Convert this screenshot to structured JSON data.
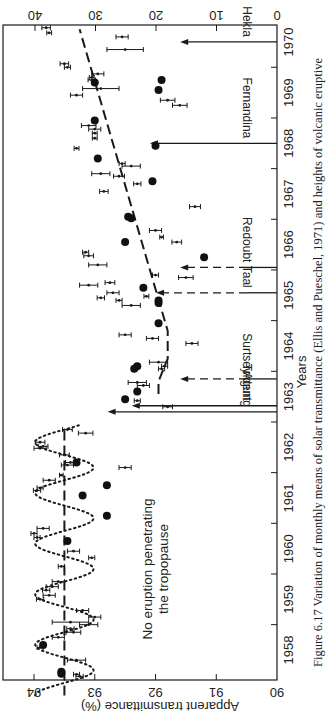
{
  "chart_data": {
    "type": "scatter",
    "title": "",
    "caption": "Figure 6.17 Variation of monthly means of solar transmittance (Ellis and Pueschel, 1971) and heights of volcanic eruptive",
    "xlabel": "Years",
    "ylabel": "Apparent transmittance (%)",
    "ylabel_right": "",
    "xlim": [
      1957.6,
      1970.5
    ],
    "ylim": [
      90,
      94.4
    ],
    "ylim_right": [
      0,
      44
    ],
    "x_ticks": [
      1958,
      1959,
      1960,
      1961,
      1962,
      1963,
      1964,
      1965,
      1966,
      1967,
      1968,
      1969,
      1970
    ],
    "y_ticks": [
      90,
      91,
      92,
      93,
      94
    ],
    "y_ticks_right": [
      0,
      10,
      20,
      30,
      40
    ],
    "grid": false,
    "annotation": "No eruption penetrating the tropopause",
    "series": [
      {
        "name": "Monthly mean transmittance (with error bars)",
        "marker": "dot-errorbar",
        "points": [
          {
            "x": 1957.62,
            "y": 93.9,
            "e": 0.05
          },
          {
            "x": 1957.78,
            "y": 93.65,
            "e": 0.12
          },
          {
            "x": 1957.9,
            "y": 93.3,
            "e": 0.1
          },
          {
            "x": 1957.98,
            "y": 93.25,
            "e": 0.06
          },
          {
            "x": 1958.02,
            "y": 93.3,
            "e": 0.05
          },
          {
            "x": 1958.3,
            "y": 93.3,
            "e": 0.15
          },
          {
            "x": 1958.55,
            "y": 93.9,
            "e": 0.05
          },
          {
            "x": 1958.75,
            "y": 93.6,
            "e": 0.1
          },
          {
            "x": 1958.85,
            "y": 93.35,
            "e": 0.12
          },
          {
            "x": 1958.92,
            "y": 93.4,
            "e": 0.06
          },
          {
            "x": 1959.0,
            "y": 93.1,
            "e": 0.15
          },
          {
            "x": 1959.05,
            "y": 93.4,
            "e": 0.3
          },
          {
            "x": 1959.15,
            "y": 93.0,
            "e": 0.1
          },
          {
            "x": 1959.28,
            "y": 93.2,
            "e": 0.1
          },
          {
            "x": 1959.5,
            "y": 93.9,
            "e": 0.06
          },
          {
            "x": 1959.58,
            "y": 93.75,
            "e": 0.1
          },
          {
            "x": 1959.68,
            "y": 93.8,
            "e": 0.06
          },
          {
            "x": 1959.75,
            "y": 93.7,
            "e": 0.1
          },
          {
            "x": 1959.85,
            "y": 93.6,
            "e": 0.1
          },
          {
            "x": 1960.15,
            "y": 93.55,
            "e": 0.05
          },
          {
            "x": 1960.32,
            "y": 93.05,
            "e": 0.05
          },
          {
            "x": 1960.45,
            "y": 93.35,
            "e": 0.1
          },
          {
            "x": 1960.72,
            "y": 93.95,
            "e": 0.05
          },
          {
            "x": 1960.8,
            "y": 94.0,
            "e": 0.05
          },
          {
            "x": 1960.9,
            "y": 93.85,
            "e": 0.1
          },
          {
            "x": 1961.65,
            "y": 93.95,
            "e": 0.06
          },
          {
            "x": 1961.7,
            "y": 93.9,
            "e": 0.05
          },
          {
            "x": 1961.85,
            "y": 93.75,
            "e": 0.1
          },
          {
            "x": 1961.95,
            "y": 93.55,
            "e": 0.03
          },
          {
            "x": 1962.1,
            "y": 92.5,
            "e": 0.1
          },
          {
            "x": 1962.15,
            "y": 93.45,
            "e": 0.1
          },
          {
            "x": 1962.2,
            "y": 93.4,
            "e": 0.08
          },
          {
            "x": 1962.35,
            "y": 93.5,
            "e": 0.08
          },
          {
            "x": 1962.48,
            "y": 93.9,
            "e": 0.1
          },
          {
            "x": 1962.52,
            "y": 93.85,
            "e": 0.08
          },
          {
            "x": 1962.6,
            "y": 93.9,
            "e": 0.08
          },
          {
            "x": 1962.78,
            "y": 93.15,
            "e": 0.12
          },
          {
            "x": 1962.85,
            "y": 93.45,
            "e": 0.08
          },
          {
            "x": 1963.3,
            "y": 91.8,
            "e": 0.08
          },
          {
            "x": 1963.42,
            "y": 92.3,
            "e": 0.05
          },
          {
            "x": 1963.72,
            "y": 92.2,
            "e": 0.1
          },
          {
            "x": 1963.78,
            "y": 92.3,
            "e": 0.15
          },
          {
            "x": 1964.05,
            "y": 91.9,
            "e": 0.05
          },
          {
            "x": 1964.1,
            "y": 91.85,
            "e": 0.05
          },
          {
            "x": 1964.18,
            "y": 91.95,
            "e": 0.15
          },
          {
            "x": 1964.55,
            "y": 91.4,
            "e": 0.1
          },
          {
            "x": 1964.65,
            "y": 92.05,
            "e": 0.1
          },
          {
            "x": 1964.72,
            "y": 92.5,
            "e": 0.1
          },
          {
            "x": 1965.3,
            "y": 92.4,
            "e": 0.15
          },
          {
            "x": 1965.4,
            "y": 92.6,
            "e": 0.05
          },
          {
            "x": 1965.45,
            "y": 92.9,
            "e": 0.06
          },
          {
            "x": 1965.48,
            "y": 92.15,
            "e": 0.04
          },
          {
            "x": 1965.55,
            "y": 92.7,
            "e": 0.1
          },
          {
            "x": 1965.7,
            "y": 93.1,
            "e": 0.15
          },
          {
            "x": 1965.75,
            "y": 92.75,
            "e": 0.08
          },
          {
            "x": 1965.85,
            "y": 91.5,
            "e": 0.12
          },
          {
            "x": 1965.9,
            "y": 92.0,
            "e": 0.05
          },
          {
            "x": 1966.1,
            "y": 92.95,
            "e": 0.15
          },
          {
            "x": 1966.28,
            "y": 93.1,
            "e": 0.08
          },
          {
            "x": 1966.35,
            "y": 93.15,
            "e": 0.05
          },
          {
            "x": 1966.55,
            "y": 91.65,
            "e": 0.08
          },
          {
            "x": 1966.65,
            "y": 91.9,
            "e": 0.03
          },
          {
            "x": 1966.78,
            "y": 92.0,
            "e": 0.1
          },
          {
            "x": 1967.25,
            "y": 91.35,
            "e": 0.09
          },
          {
            "x": 1967.55,
            "y": 92.85,
            "e": 0.07
          },
          {
            "x": 1967.7,
            "y": 92.3,
            "e": 0.06
          },
          {
            "x": 1967.85,
            "y": 92.6,
            "e": 0.09
          },
          {
            "x": 1967.9,
            "y": 92.9,
            "e": 0.15
          },
          {
            "x": 1968.05,
            "y": 92.4,
            "e": 0.15
          },
          {
            "x": 1968.1,
            "y": 92.55,
            "e": 0.05
          },
          {
            "x": 1968.4,
            "y": 93.3,
            "e": 0.04
          },
          {
            "x": 1968.6,
            "y": 93.0,
            "e": 0.04
          },
          {
            "x": 1968.7,
            "y": 93.0,
            "e": 0.04
          },
          {
            "x": 1968.78,
            "y": 93.0,
            "e": 0.1
          },
          {
            "x": 1968.85,
            "y": 93.1,
            "e": 0.12
          },
          {
            "x": 1969.25,
            "y": 91.6,
            "e": 0.12
          },
          {
            "x": 1969.35,
            "y": 91.8,
            "e": 0.12
          },
          {
            "x": 1969.45,
            "y": 93.3,
            "e": 0.1
          },
          {
            "x": 1969.58,
            "y": 92.9,
            "e": 0.3
          },
          {
            "x": 1969.75,
            "y": 93.05,
            "e": 0.06
          },
          {
            "x": 1969.8,
            "y": 93.05,
            "e": 0.04
          },
          {
            "x": 1969.87,
            "y": 92.95,
            "e": 0.1
          },
          {
            "x": 1970.0,
            "y": 93.45,
            "e": 0.05
          },
          {
            "x": 1970.07,
            "y": 93.5,
            "e": 0.07
          },
          {
            "x": 1970.35,
            "y": 92.5,
            "e": 0.3
          },
          {
            "x": 1970.6,
            "y": 92.55,
            "e": 0.1
          },
          {
            "x": 1970.68,
            "y": 93.75,
            "e": 0.04
          },
          {
            "x": 1970.78,
            "y": 93.8,
            "e": 0.07
          },
          {
            "x": 1970.85,
            "y": 93.65,
            "e": 0.08
          },
          {
            "x": 1971.05,
            "y": 93.3,
            "e": 0.08
          }
        ]
      },
      {
        "name": "Solid dots",
        "marker": "filled-circle",
        "points": [
          {
            "x": 1958.03,
            "y": 93.55
          },
          {
            "x": 1958.07,
            "y": 93.55
          },
          {
            "x": 1958.6,
            "y": 93.85
          },
          {
            "x": 1960.65,
            "y": 93.45
          },
          {
            "x": 1961.15,
            "y": 92.8
          },
          {
            "x": 1961.55,
            "y": 93.2
          },
          {
            "x": 1961.75,
            "y": 92.8
          },
          {
            "x": 1962.2,
            "y": 93.3
          },
          {
            "x": 1963.45,
            "y": 92.5
          },
          {
            "x": 1963.6,
            "y": 92.3
          },
          {
            "x": 1964.05,
            "y": 92.35
          },
          {
            "x": 1964.1,
            "y": 92.3
          },
          {
            "x": 1964.95,
            "y": 91.95
          },
          {
            "x": 1965.35,
            "y": 91.95
          },
          {
            "x": 1965.4,
            "y": 91.95
          },
          {
            "x": 1965.65,
            "y": 92.2
          },
          {
            "x": 1966.25,
            "y": 91.2
          },
          {
            "x": 1966.55,
            "y": 92.5
          },
          {
            "x": 1967.02,
            "y": 92.4
          },
          {
            "x": 1967.05,
            "y": 92.45
          },
          {
            "x": 1967.75,
            "y": 92.05
          },
          {
            "x": 1968.2,
            "y": 92.95
          },
          {
            "x": 1968.45,
            "y": 92.0
          },
          {
            "x": 1968.95,
            "y": 93.0
          },
          {
            "x": 1969.55,
            "y": 91.95
          },
          {
            "x": 1969.7,
            "y": 93.0
          },
          {
            "x": 1969.75,
            "y": 91.9
          }
        ]
      },
      {
        "name": "Dotted sinusoid (pre-1963)",
        "style": "dotted",
        "x_range": [
          1957.6,
          1962.95
        ],
        "mean": 93.5,
        "amplitude": 0.48,
        "period_years": 1.0,
        "phase_peak": 1958.6
      },
      {
        "name": "Dashed mean line",
        "style": "long-dash",
        "points": [
          {
            "x": 1957.6,
            "y": 93.5
          },
          {
            "x": 1962.9,
            "y": 93.5
          }
        ]
      },
      {
        "name": "Dashed trend (post-Agung)",
        "style": "long-dash",
        "points": [
          {
            "x": 1963.55,
            "y": 91.95
          },
          {
            "x": 1963.8,
            "y": 91.95
          },
          {
            "x": 1964.25,
            "y": 91.8
          },
          {
            "x": 1964.8,
            "y": 91.8
          },
          {
            "x": 1970.75,
            "y": 93.25
          }
        ]
      }
    ],
    "eruptions": [
      {
        "name": "Agung",
        "x": 1963.2,
        "height_km": 28,
        "style": "solid"
      },
      {
        "name": "Trident",
        "x": 1963.32,
        "height_km": 24,
        "style": "solid"
      },
      {
        "name": "Surtsey",
        "x": 1963.85,
        "height_km": 16,
        "style": "dashed"
      },
      {
        "name": "Taal",
        "x": 1965.55,
        "height_km": 20,
        "style": "dashed"
      },
      {
        "name": "Redoubt",
        "x": 1966.05,
        "height_km": 16,
        "style": "dashed"
      },
      {
        "name": "Fernandina",
        "x": 1968.5,
        "height_km": 21,
        "style": "solid"
      },
      {
        "name": "Hekla",
        "x": 1970.5,
        "height_km": 16,
        "style": "solid"
      }
    ]
  }
}
